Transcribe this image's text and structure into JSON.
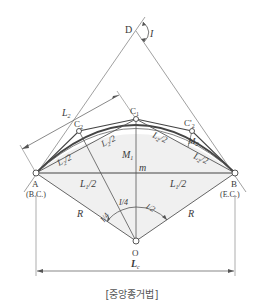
{
  "diagram": {
    "title": "[중앙종거법]",
    "points": {
      "D": {
        "label": "D",
        "x": 136,
        "y": 31
      },
      "C1": {
        "label": "C",
        "sub": "1",
        "x": 136,
        "y": 119
      },
      "C2": {
        "label": "C",
        "sub": "2",
        "x": 79,
        "y": 131
      },
      "C2p": {
        "label": "C'",
        "sub": "2",
        "x": 192,
        "y": 131
      },
      "A": {
        "label": "A",
        "note": "(B.C.)",
        "x": 36,
        "y": 173
      },
      "B": {
        "label": "B",
        "note": "(E.C.)",
        "x": 235,
        "y": 173
      },
      "O": {
        "label": "O",
        "x": 136,
        "y": 241
      },
      "m": {
        "label": "m",
        "x": 136,
        "y": 173
      }
    },
    "labels": {
      "angle_I": "I",
      "L2": "L",
      "L2_sub": "2",
      "L2_half": "L",
      "half_suffix": "/2",
      "L1_half": "L",
      "M1": "M",
      "M1_sub": "1",
      "M2": "M",
      "M2_sub": "2",
      "R": "R",
      "I4": "I/4",
      "I2": "I/2",
      "Lc": "L",
      "Lc_sub": "c",
      "sub1": "1",
      "sub2": "2"
    },
    "colors": {
      "line": "#555555",
      "arc": "#444444",
      "shade": "#eeeeee"
    }
  }
}
